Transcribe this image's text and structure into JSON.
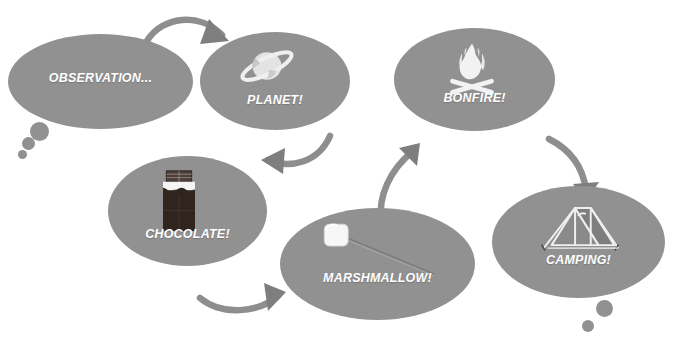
{
  "diagram": {
    "type": "cycle-flow",
    "background_color": "#ffffff",
    "bubble_color": "#919191",
    "arrow_color": "#8a8a8a",
    "label_color": "#ffffff",
    "nodes": [
      {
        "id": "observation",
        "label": "OBSERVATION...",
        "icon": "none",
        "shape": "thought-bubble",
        "x": 8,
        "y": 34,
        "w": 185,
        "h": 95,
        "label_y": 36,
        "tail_dots": [
          {
            "x": 22,
            "y": 122,
            "d": 19
          },
          {
            "x": 14,
            "y": 136,
            "d": 13
          },
          {
            "x": 10,
            "y": 149,
            "d": 9
          }
        ]
      },
      {
        "id": "planet",
        "label": "PLANET!",
        "icon": "saturn-planet-icon",
        "shape": "ellipse",
        "x": 200,
        "y": 32,
        "w": 150,
        "h": 98,
        "label_y": 60,
        "tail_dots": []
      },
      {
        "id": "bonfire",
        "label": "BONFIRE!",
        "icon": "campfire-icon",
        "shape": "ellipse",
        "x": 394,
        "y": 28,
        "w": 161,
        "h": 103,
        "label_y": 62,
        "tail_dots": []
      },
      {
        "id": "chocolate",
        "label": "CHOCOLATE!",
        "icon": "chocolate-bar-icon",
        "shape": "ellipse",
        "x": 108,
        "y": 156,
        "w": 159,
        "h": 110,
        "label_y": 70,
        "tail_dots": []
      },
      {
        "id": "marshmallow",
        "label": "MARSHMALLOW!",
        "icon": "marshmallow-on-stick-icon",
        "shape": "ellipse",
        "x": 280,
        "y": 208,
        "w": 195,
        "h": 112,
        "label_y": 62,
        "tail_dots": []
      },
      {
        "id": "camping",
        "label": "CAMPING!",
        "icon": "tent-icon",
        "shape": "thought-bubble",
        "x": 492,
        "y": 186,
        "w": 173,
        "h": 112,
        "label_y": 66,
        "tail_dots": [
          {
            "x": 112,
            "y": 108,
            "d": 17
          },
          {
            "x": 96,
            "y": 128,
            "d": 12
          }
        ]
      }
    ],
    "arrows": [
      {
        "id": "observation-to-planet",
        "from": "observation",
        "to": "planet"
      },
      {
        "id": "planet-to-chocolate",
        "from": "planet",
        "to": "chocolate"
      },
      {
        "id": "chocolate-to-marshmallow",
        "from": "chocolate",
        "to": "marshmallow"
      },
      {
        "id": "marshmallow-to-bonfire",
        "from": "marshmallow",
        "to": "bonfire"
      },
      {
        "id": "bonfire-to-camping",
        "from": "bonfire",
        "to": "camping"
      }
    ]
  }
}
